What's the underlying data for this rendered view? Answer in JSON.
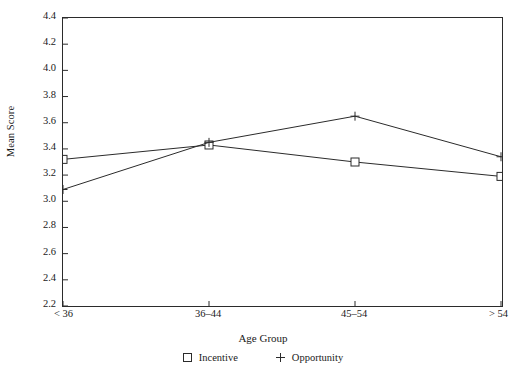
{
  "chart_data": {
    "type": "line",
    "title": "",
    "xlabel": "Age Group",
    "ylabel": "Mean Score",
    "categories": [
      "< 36",
      "36–44",
      "45–54",
      "> 54"
    ],
    "ylim": [
      2.2,
      4.4
    ],
    "ytick_step": 0.2,
    "ytick_labels": [
      "4.4",
      "4.2",
      "4.0",
      "3.8",
      "3.6",
      "3.4",
      "3.2",
      "3.0",
      "2.8",
      "2.6",
      "2.4",
      "2.2"
    ],
    "grid": false,
    "legend_position": "bottom",
    "series": [
      {
        "name": "Incentive",
        "marker": "square",
        "color": "#2b2b2b",
        "values": [
          3.32,
          3.43,
          3.3,
          3.19
        ]
      },
      {
        "name": "Opportunity",
        "marker": "plus",
        "color": "#2b2b2b",
        "values": [
          3.09,
          3.45,
          3.65,
          3.34
        ]
      }
    ]
  },
  "axes": {
    "y_title": "Mean Score",
    "x_title": "Age Group"
  },
  "legend": {
    "items": [
      {
        "label": "Incentive",
        "marker": "square-marker"
      },
      {
        "label": "Opportunity",
        "marker": "plus-marker"
      }
    ]
  },
  "colors": {
    "line": "#2b2b2b",
    "frame": "#2b2b2b",
    "background": "#ffffff"
  }
}
